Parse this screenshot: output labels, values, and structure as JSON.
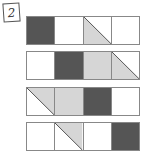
{
  "label": "2",
  "colors": {
    "dark": "#555555",
    "light": "#d6d6d6",
    "white": "#ffffff",
    "line": "#555555"
  },
  "rows": [
    {
      "cells": [
        "dark",
        "white",
        "diag-lower-left",
        "white"
      ]
    },
    {
      "cells": [
        "white",
        "dark",
        "light",
        "diag-lower-left"
      ]
    },
    {
      "cells": [
        "diag-upper-right",
        "light",
        "dark",
        "white"
      ]
    },
    {
      "cells": [
        "white",
        "diag-upper-right",
        "white",
        "dark"
      ]
    }
  ]
}
